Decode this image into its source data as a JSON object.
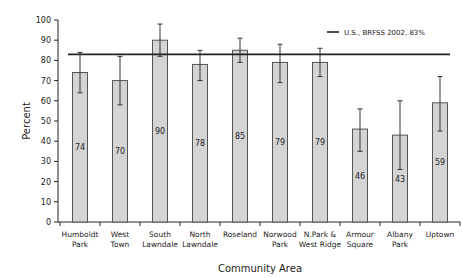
{
  "chart_data": {
    "type": "bar",
    "title": "",
    "xlabel": "Community Area",
    "ylabel": "Percent",
    "ylim": [
      0,
      100
    ],
    "yticks": [
      0,
      10,
      20,
      30,
      40,
      50,
      60,
      70,
      80,
      90,
      100
    ],
    "grid": false,
    "categories": [
      [
        "Humboldt",
        "Park"
      ],
      [
        "West",
        "Town"
      ],
      [
        "South",
        "Lawndale"
      ],
      [
        "North",
        "Lawndale"
      ],
      [
        "Roseland",
        ""
      ],
      [
        "Norwood",
        "Park"
      ],
      [
        "N.Park &",
        "West Ridge"
      ],
      [
        "Armour",
        "Square"
      ],
      [
        "Albany",
        "Park"
      ],
      [
        "Uptown",
        ""
      ]
    ],
    "values": [
      74,
      70,
      90,
      78,
      85,
      79,
      79,
      46,
      43,
      59
    ],
    "value_labels": [
      "74",
      "70",
      "90",
      "78",
      "85",
      "79",
      "79",
      "46",
      "43",
      "59"
    ],
    "error_low": [
      64,
      58,
      82,
      70,
      79,
      69,
      72,
      35,
      26,
      45
    ],
    "error_high": [
      84,
      82,
      98,
      85,
      91,
      88,
      86,
      56,
      60,
      72
    ],
    "reference_line": {
      "label": "U.S., BRFSS 2002, 83%",
      "value": 83
    },
    "legend_position": "top-right",
    "colors": {
      "bar_fill": "#d4d4d4",
      "bar_stroke": "#555555",
      "line": "#222222"
    }
  }
}
